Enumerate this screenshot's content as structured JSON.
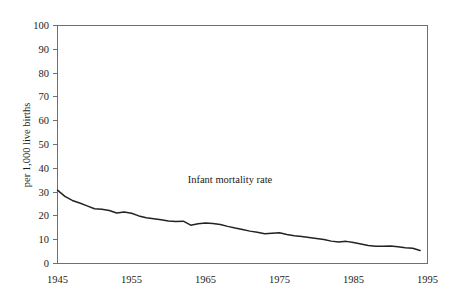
{
  "chart_data": {
    "type": "line",
    "title": "",
    "annotation": "Infant mortality rate",
    "xlabel": "",
    "ylabel": "per 1,000 live births",
    "xlim": [
      1945,
      1995
    ],
    "ylim": [
      0,
      100
    ],
    "grid": false,
    "legend_position": "none",
    "x_ticks": [
      1945,
      1955,
      1965,
      1975,
      1985,
      1995
    ],
    "y_ticks": [
      0,
      10,
      20,
      30,
      40,
      50,
      60,
      70,
      80,
      90,
      100
    ],
    "line_color": "#222222",
    "axis_color": "#6f6f6f",
    "series": [
      {
        "name": "Infant mortality rate",
        "x": [
          1945,
          1946,
          1947,
          1948,
          1949,
          1950,
          1951,
          1952,
          1953,
          1954,
          1955,
          1956,
          1957,
          1958,
          1959,
          1960,
          1961,
          1962,
          1963,
          1964,
          1965,
          1966,
          1967,
          1968,
          1969,
          1970,
          1971,
          1972,
          1973,
          1974,
          1975,
          1976,
          1977,
          1978,
          1979,
          1980,
          1981,
          1982,
          1983,
          1984,
          1985,
          1986,
          1987,
          1988,
          1989,
          1990,
          1991,
          1992,
          1993,
          1994
        ],
        "values": [
          30.8,
          28.2,
          26.5,
          25.4,
          24.2,
          23.0,
          22.8,
          22.3,
          21.2,
          21.6,
          21.1,
          20.0,
          19.2,
          18.8,
          18.4,
          17.9,
          17.6,
          17.8,
          16.1,
          16.7,
          17.0,
          16.8,
          16.4,
          15.6,
          14.9,
          14.3,
          13.6,
          13.1,
          12.5,
          12.7,
          12.9,
          12.2,
          11.7,
          11.3,
          10.9,
          10.5,
          10.1,
          9.4,
          9.0,
          9.3,
          8.8,
          8.2,
          7.6,
          7.3,
          7.2,
          7.4,
          7.0,
          6.6,
          6.4,
          5.5
        ]
      }
    ]
  },
  "figure": {
    "y_axis_title": "per 1,000 live births",
    "annotation_label": "Infant mortality rate",
    "y_tick_labels": [
      "100",
      "90",
      "80",
      "70",
      "60",
      "50",
      "40",
      "30",
      "20",
      "10",
      "0"
    ],
    "x_tick_labels": [
      "1945",
      "1955",
      "1965",
      "1975",
      "1985",
      "1995"
    ]
  }
}
